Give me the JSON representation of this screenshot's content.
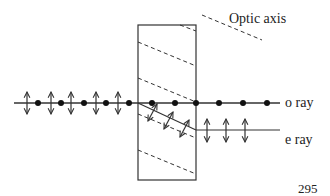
{
  "labels": {
    "optic_axis": "Optic axis",
    "o_ray": "o ray",
    "e_ray": "e ray",
    "page_number": "295"
  },
  "colors": {
    "line": "#333333",
    "background": "#ffffff"
  },
  "geometry": {
    "crystal": {
      "x": 138,
      "y": 25,
      "width": 58,
      "height": 155
    },
    "incident_ray_y": 103,
    "e_ray_exit_y": 130,
    "ray_end_x": 280,
    "incident_arrows_x": [
      27,
      51,
      71,
      96,
      118
    ],
    "incident_dots_x": [
      38,
      61,
      84,
      106,
      129
    ],
    "o_ray_dots_x": [
      152,
      175,
      196,
      219,
      243,
      267
    ],
    "e_ray_arrows_x": [
      207,
      226,
      245
    ],
    "optic_axis_dashes": [
      [
        [
          138,
          42
        ],
        [
          196,
          66
        ]
      ],
      [
        [
          138,
          78
        ],
        [
          196,
          102
        ]
      ],
      [
        [
          138,
          114
        ],
        [
          196,
          138
        ]
      ],
      [
        [
          138,
          150
        ],
        [
          196,
          174
        ]
      ],
      [
        [
          180,
          25
        ],
        [
          196,
          31
        ]
      ],
      [
        [
          202,
          15
        ],
        [
          262,
          40
        ]
      ]
    ]
  }
}
